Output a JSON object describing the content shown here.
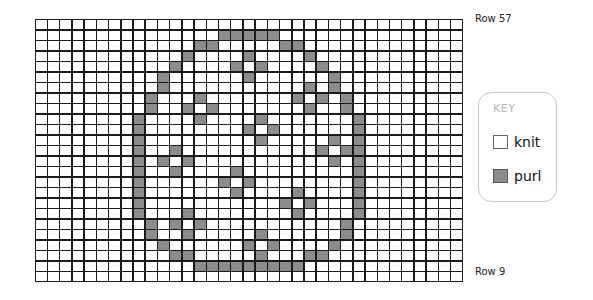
{
  "chart": {
    "columns": 35,
    "rows": 25,
    "row_label_top": "Row 57",
    "row_label_bottom": "Row 9",
    "colors": {
      "knit": "#ffffff",
      "purl": "#8c8c8c",
      "grid": "#1a1a1a"
    },
    "purl_cells_by_row": [
      [],
      [
        15,
        16,
        17,
        18,
        19
      ],
      [
        13,
        14,
        20,
        21
      ],
      [
        12,
        17,
        22
      ],
      [
        11,
        16,
        18,
        23
      ],
      [
        10,
        17,
        24
      ],
      [
        10,
        22,
        24
      ],
      [
        9,
        13,
        21,
        23,
        25
      ],
      [
        9,
        12,
        14,
        22,
        25
      ],
      [
        8,
        13,
        18,
        26
      ],
      [
        8,
        17,
        19,
        26
      ],
      [
        8,
        18,
        24,
        26
      ],
      [
        8,
        11,
        23,
        25,
        26
      ],
      [
        8,
        10,
        12,
        24,
        26
      ],
      [
        8,
        11,
        16,
        26
      ],
      [
        8,
        15,
        17,
        26
      ],
      [
        8,
        16,
        21,
        26
      ],
      [
        8,
        20,
        22,
        26
      ],
      [
        8,
        12,
        21,
        26
      ],
      [
        9,
        11,
        13,
        25
      ],
      [
        9,
        12,
        18,
        25
      ],
      [
        10,
        17,
        19,
        24
      ],
      [
        11,
        12,
        18,
        22,
        23
      ],
      [
        13,
        14,
        15,
        16,
        17,
        18,
        19,
        20,
        21
      ],
      []
    ]
  },
  "key": {
    "title": "KEY",
    "items": [
      {
        "symbol": "knit-swatch",
        "label": "knit"
      },
      {
        "symbol": "purl-swatch",
        "label": "purl"
      }
    ]
  }
}
